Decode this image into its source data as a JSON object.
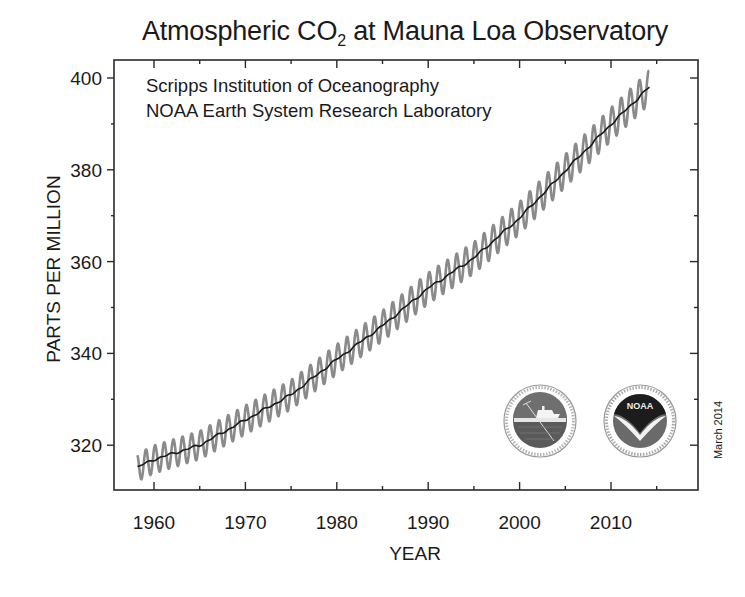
{
  "chart_data": {
    "type": "line",
    "title": "Atmospheric CO2 at Mauna Loa Observatory",
    "title_main": "Atmospheric CO",
    "title_sub": "2",
    "title_rest": " at Mauna Loa Observatory",
    "xlabel": "YEAR",
    "ylabel": "PARTS PER MILLION",
    "xlim": [
      1955.8,
      2016.2
    ],
    "ylim": [
      311,
      404
    ],
    "x_ticks": [
      1960,
      1970,
      1980,
      1990,
      2000,
      2010
    ],
    "x_minor_ticks": [
      1965,
      1975,
      1985,
      1995,
      2005,
      2015
    ],
    "y_ticks": [
      320,
      340,
      360,
      380,
      400
    ],
    "y_minor_ticks": [
      330,
      350,
      370,
      390
    ],
    "grid": false,
    "legend": "none",
    "annotations": [
      "Scripps Institution of Oceanography",
      "NOAA Earth System Research Laboratory",
      "March 2014"
    ],
    "series": [
      {
        "name": "Monthly mean CO2 (seasonal cycle)",
        "style": "gray oscillating line",
        "color": "#8a8a8a",
        "seasonal_amplitude_ppm": 3.0,
        "x": [
          1958,
          1960,
          1965,
          1970,
          1975,
          1980,
          1985,
          1990,
          1995,
          2000,
          2005,
          2010,
          2014.2
        ],
        "values": [
          315.0,
          316.9,
          320.0,
          325.5,
          331.0,
          338.7,
          346.0,
          354.2,
          360.8,
          369.5,
          379.8,
          389.9,
          398.0
        ]
      },
      {
        "name": "Seasonally adjusted trend",
        "style": "black line",
        "color": "#1a1a1a",
        "x": [
          1958,
          1960,
          1965,
          1970,
          1975,
          1980,
          1985,
          1990,
          1995,
          2000,
          2005,
          2010,
          2014.2
        ],
        "values": [
          315.0,
          316.9,
          320.0,
          325.5,
          331.0,
          338.7,
          346.0,
          354.2,
          360.8,
          369.5,
          379.8,
          389.9,
          398.0
        ]
      }
    ]
  },
  "header": {
    "title_main": "Atmospheric CO",
    "title_sub": "2",
    "title_rest": " at Mauna Loa Observatory"
  },
  "axes": {
    "xlabel": "YEAR",
    "ylabel": "PARTS PER MILLION"
  },
  "credits": {
    "line1": "Scripps Institution of Oceanography",
    "line2": "NOAA Earth System Research Laboratory",
    "date_stamp": "March 2014"
  },
  "logos": {
    "scripps": "scripps-logo",
    "noaa": "NOAA"
  },
  "colors": {
    "seasonal": "#8a8a8a",
    "trend": "#1a1a1a",
    "frame": "#2a2a2a"
  }
}
